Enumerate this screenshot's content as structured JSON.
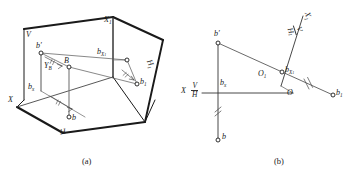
{
  "figure": {
    "type": "descriptive-geometry-projection-diagram",
    "panels": [
      {
        "id": "a",
        "caption": "(a)",
        "description": "Pictorial view of point B with projection planes V, H and auxiliary plane H1",
        "labels": {
          "plane_v": "V",
          "plane_h": "H",
          "plane_h1": "H1",
          "axis_x": "X",
          "axis_x1": "X1",
          "point_b_prime": "b′",
          "point_b": "b",
          "point_b_space": "B",
          "point_b1": "b₁",
          "point_bx": "b",
          "point_bx_sub": "x",
          "point_bx1": "b",
          "point_bx1_sub": "X₁",
          "distance_yb": "Y",
          "distance_yb_sub": "B"
        }
      },
      {
        "id": "b",
        "caption": "(b)",
        "description": "Orthographic projection drawing with V/H and V/H1 fold lines",
        "labels": {
          "axis_x": "X",
          "axis_x1": "X1",
          "origin_o": "O",
          "origin_o1": "O₁",
          "point_b_prime": "b′",
          "point_b": "b",
          "point_b1": "b₁",
          "point_bx": "b",
          "point_bx_sub": "x",
          "point_bx1": "b",
          "point_bx1_sub": "X₁",
          "fold_vh_num": "V",
          "fold_vh_den": "H",
          "fold_vh1_num": "V",
          "fold_vh1_den": "H₁"
        }
      }
    ]
  },
  "colors": {
    "stroke_dark": "#1a1a1a",
    "stroke_thin": "#555555",
    "background": "#ffffff"
  }
}
